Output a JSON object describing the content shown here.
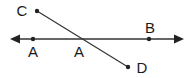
{
  "diagram": {
    "type": "geometry",
    "line": {
      "name": "horizontal-line",
      "from": [
        10,
        39
      ],
      "to": [
        184,
        39
      ],
      "arrows": "both"
    },
    "segment": {
      "name": "segment-CD",
      "from": "C",
      "to": "D"
    },
    "points": [
      {
        "id": "A1",
        "label": "A",
        "x": 33,
        "y": 39,
        "label_x": 33,
        "label_y": 57
      },
      {
        "id": "A2",
        "label": "A",
        "x": 82,
        "y": 39,
        "label_x": 79,
        "label_y": 57,
        "is_intersection": true
      },
      {
        "id": "B",
        "label": "B",
        "x": 149,
        "y": 39,
        "label_x": 150,
        "label_y": 33
      },
      {
        "id": "C",
        "label": "C",
        "x": 37,
        "y": 11,
        "label_x": 22,
        "label_y": 16
      },
      {
        "id": "D",
        "label": "D",
        "x": 128,
        "y": 67,
        "label_x": 141,
        "label_y": 73
      }
    ],
    "colors": {
      "stroke": "#333333",
      "point": "#222222",
      "text": "#1a1a1a"
    }
  }
}
